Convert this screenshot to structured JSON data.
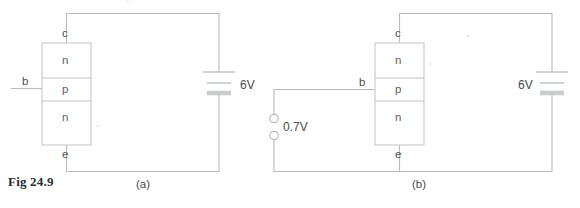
{
  "figure": {
    "caption_label": "Fig 24.9",
    "top_clipped_artifact": "p",
    "background_color": "#ffffff",
    "wire_color": "#b9bcbe",
    "text_color": "#555759"
  },
  "panels": [
    {
      "id": "panel-a",
      "sub_caption": "(a)",
      "transistor": {
        "type": "npn",
        "layers": [
          "n",
          "p",
          "n"
        ],
        "terminals": {
          "collector": "c",
          "base": "b",
          "emitter": "e"
        }
      },
      "sources": [
        {
          "name": "collector-supply",
          "symbol": "battery",
          "label": "6V",
          "label_side": "right"
        }
      ]
    },
    {
      "id": "panel-b",
      "sub_caption": "(b)",
      "transistor": {
        "type": "npn",
        "layers": [
          "n",
          "p",
          "n"
        ],
        "terminals": {
          "collector": "c",
          "base": "b",
          "emitter": "e"
        }
      },
      "sources": [
        {
          "name": "base-supply",
          "symbol": "open-terminals",
          "label": "0.7V",
          "label_side": "right"
        },
        {
          "name": "collector-supply",
          "symbol": "battery",
          "label": "6V",
          "label_side": "left"
        }
      ]
    }
  ]
}
